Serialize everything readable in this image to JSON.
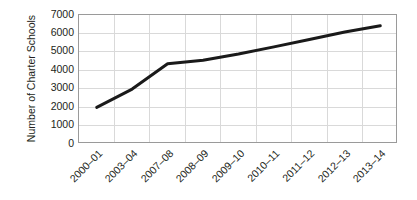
{
  "chart_data": {
    "type": "line",
    "title": "",
    "xlabel": "",
    "ylabel": "Number of Charter Schools",
    "categories": [
      "2000–01",
      "2003–04",
      "2007–08",
      "2008–09",
      "2009–10",
      "2010–11",
      "2011–12",
      "2012–13",
      "2013–14"
    ],
    "values": [
      1990,
      2980,
      4350,
      4550,
      4880,
      5270,
      5670,
      6080,
      6420
    ],
    "series": [
      {
        "name": "Number of Charter Schools",
        "values": [
          1990,
          2980,
          4350,
          4550,
          4880,
          5270,
          5670,
          6080,
          6420
        ]
      }
    ],
    "ylim": [
      0,
      7000
    ],
    "yticks": [
      0,
      1000,
      2000,
      3000,
      4000,
      5000,
      6000,
      7000
    ],
    "ytick_labels": [
      "0",
      "1000",
      "2000",
      "3000",
      "4000",
      "5000",
      "6000",
      "7000"
    ],
    "grid": true,
    "grid_axes": "both",
    "legend": "none",
    "line_color": "#1a1a1a",
    "grid_color": "#d9d9d9",
    "axis_color": "#9a9a9a",
    "background_color": "#ffffff",
    "text_color": "#231f20",
    "line_width": 3,
    "xtick_rotation": -45
  }
}
